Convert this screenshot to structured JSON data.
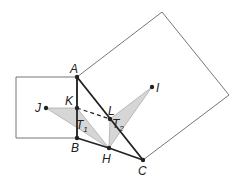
{
  "diagram": {
    "colors": {
      "square_stroke": "#777777",
      "segment_stroke": "#222222",
      "triangle_fill": "#d6d6d6",
      "point_fill": "#222222"
    },
    "points": {
      "A": {
        "label": "A",
        "x": 77,
        "y": 77
      },
      "B": {
        "label": "B",
        "x": 77,
        "y": 138
      },
      "C": {
        "label": "C",
        "x": 143,
        "y": 160
      },
      "H": {
        "label": "H",
        "x": 109,
        "y": 148
      },
      "I": {
        "label": "I",
        "x": 152,
        "y": 87
      },
      "J": {
        "label": "J",
        "x": 46,
        "y": 108
      },
      "K": {
        "label": "K",
        "x": 77,
        "y": 108
      },
      "L": {
        "label": "L",
        "x": 110,
        "y": 119
      }
    },
    "triangles": [
      {
        "label": "T",
        "subscript": "1",
        "vertices": [
          "J",
          "K",
          "H"
        ]
      },
      {
        "label": "T",
        "subscript": "2",
        "vertices": [
          "L",
          "I",
          "H"
        ]
      }
    ],
    "squares": [
      {
        "name": "square-on-AB",
        "vertices": [
          [
            77,
            77
          ],
          [
            16,
            77
          ],
          [
            16,
            138
          ],
          [
            77,
            138
          ]
        ]
      },
      {
        "name": "square-on-AC",
        "vertices": [
          [
            77,
            77
          ],
          [
            162,
            12
          ],
          [
            229,
            95
          ],
          [
            143,
            160
          ]
        ]
      }
    ],
    "segments": [
      {
        "from": "A",
        "to": "B",
        "style": "solid"
      },
      {
        "from": "A",
        "to": "C",
        "style": "solid"
      },
      {
        "from": "B",
        "to": "H",
        "style": "solid"
      },
      {
        "from": "H",
        "to": "C",
        "style": "solid"
      },
      {
        "from": "K",
        "to": "L",
        "style": "dashed"
      }
    ]
  }
}
